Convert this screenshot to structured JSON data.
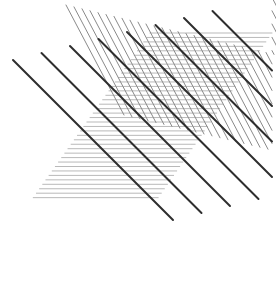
{
  "canvas": {
    "width": 276,
    "height": 292,
    "background_color": "#ffffff",
    "title": "Abstract Line Hatching Composition"
  },
  "palette": {
    "background": "#ffffff",
    "horizontal_line_color": "#b9b9b9",
    "steep_diagonal_color": "#8a8a8a",
    "thick_diagonal_color": "#2e2e2e"
  },
  "line_families": [
    {
      "name": "horizontal-lines",
      "label": "Horizontal hatching",
      "orientation": "horizontal",
      "angle_degrees": 0,
      "color": "#b9b9b9",
      "stroke_width": 1.0,
      "count": 38,
      "spacing_px": 4.45,
      "first_y": 33,
      "last_y": 198,
      "left_edge_top_x": 150,
      "left_edge_bottom_x": 33,
      "right_edge_top_x": 272,
      "right_edge_bottom_x": 158,
      "edge_slope_note": "both ends slant left going down, parallelogram shape"
    },
    {
      "name": "steep-diagonal-lines",
      "label": "Steep thin diagonals",
      "orientation": "descending-right",
      "angle_degrees": 62,
      "color": "#8a8a8a",
      "stroke_width": 1.0,
      "count": 34,
      "spacing_px": 8.0,
      "dx": 58,
      "dy": 110,
      "top_start_x": 66,
      "top_start_y": 5,
      "band_length_px": 124
    },
    {
      "name": "thick-diagonal-lines",
      "label": "Thick dark diagonals",
      "orientation": "descending-right",
      "angle_degrees": 45,
      "color": "#2e2e2e",
      "stroke_width": 2.0,
      "count": 8,
      "spacing_px": 28.5,
      "dx": 160,
      "dy": 160,
      "first_start_x": 13,
      "first_start_y": 60,
      "extends_beyond_hatching": true
    }
  ]
}
